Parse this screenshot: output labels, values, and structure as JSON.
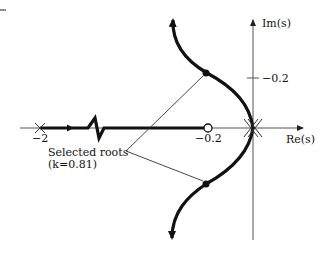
{
  "diagram": {
    "type": "root-locus",
    "axes": {
      "real_label": "Re(s)",
      "imag_label": "Im(s)",
      "real_ticks": [
        "−2",
        "−0.2"
      ],
      "imag_ticks": [
        "−0.2"
      ]
    },
    "poles": [
      {
        "label": "−2",
        "location": "-2"
      },
      {
        "label": "0 (double)",
        "location": "0"
      }
    ],
    "zeros": [
      {
        "label": "−0.2",
        "location": "-0.2"
      }
    ],
    "annotation": {
      "line1": "Selected roots",
      "line2": "(k=0.81)",
      "k_symbol": "k",
      "k_value": "=0.81)"
    },
    "colors": {
      "locus": "#111111",
      "axis": "#333333",
      "background": "#ffffff"
    }
  }
}
